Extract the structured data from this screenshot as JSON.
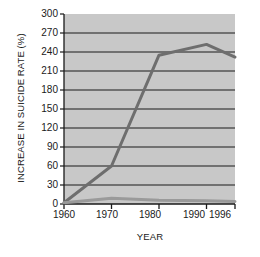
{
  "chart_data": {
    "type": "line",
    "title": "",
    "xlabel": "YEAR",
    "ylabel": "INCREASE IN SUICIDE RATE (%)",
    "x": [
      1960,
      1970,
      1980,
      1990,
      1996
    ],
    "xlim": [
      1960,
      1996
    ],
    "ylim": [
      0,
      300
    ],
    "xticks": [
      "1960",
      "1970",
      "1980",
      "1990",
      "1996"
    ],
    "yticks": [
      "0",
      "30",
      "60",
      "90",
      "120",
      "150",
      "180",
      "210",
      "240",
      "270",
      "300"
    ],
    "grid": "horizontal",
    "legend_position": "inline-annotation",
    "plot_background": "#c8c8c8",
    "series": [
      {
        "name": "Youth",
        "label": "",
        "color": "#6e6e6e",
        "values": [
          2,
          60,
          235,
          252,
          232
        ]
      },
      {
        "name": "All ages",
        "label": "All ages",
        "color": "#9a9a9a",
        "values": [
          2,
          9,
          6,
          5,
          4
        ]
      }
    ],
    "annotations": [
      {
        "text": "All ages",
        "x": 1987,
        "y": 22
      }
    ]
  },
  "axis": {
    "y_title": "INCREASE IN SUICIDE RATE (%)",
    "x_title": "YEAR"
  }
}
